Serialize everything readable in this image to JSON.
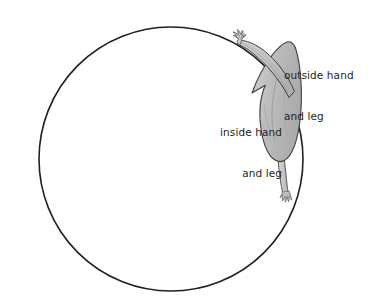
{
  "diagram": {
    "background_color": "#ffffff",
    "circle": {
      "name": "training-circle",
      "center_x": 171,
      "center_y": 159,
      "radius": 132,
      "stroke_color": "#231f20",
      "stroke_width": 1.6,
      "fill": "none"
    },
    "figure": {
      "name": "rider-body-top-view",
      "fill_color": "#bcbcbc",
      "fill_color_light": "#d6d6d6",
      "fill_color_shadow": "#a8a8a8",
      "outline_color": "#3a3a3a",
      "description": "top-down silhouette of a person with both arms extended toward upper-left and one leg extending down-right"
    },
    "labels": {
      "outside": {
        "line1": "outside hand",
        "line2": "and leg",
        "color": "#231f20",
        "align": "left"
      },
      "inside": {
        "line1": "inside hand",
        "line2": "and leg",
        "color": "#231f20",
        "align": "right"
      }
    }
  }
}
